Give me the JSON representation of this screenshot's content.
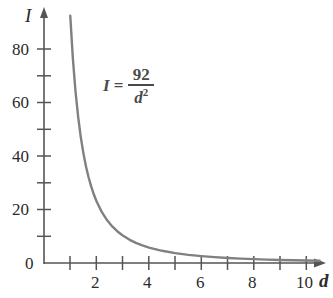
{
  "figure": {
    "background_color": "#ffffff",
    "curve_color": "#808080",
    "axis_color": "#555555",
    "text_color": "#2b2b2b",
    "annotation_color": "#4a4a4a"
  },
  "annotation": {
    "lhs": "I",
    "relation": "=",
    "numerator": "92",
    "denominator": "d",
    "denominator_exponent": "2",
    "full_text": "I = 92/d^2"
  },
  "axes": {
    "x_title": "d",
    "y_title": "I",
    "x_tick_labels": [
      "2",
      "4",
      "6",
      "8",
      "10"
    ],
    "y_tick_labels": [
      "0",
      "20",
      "40",
      "60",
      "80"
    ]
  },
  "chart_data": {
    "type": "line",
    "title": "",
    "subtitle": "",
    "xlabel": "d",
    "ylabel": "I",
    "xlim": [
      0,
      11.2
    ],
    "ylim": [
      0,
      92
    ],
    "grid": false,
    "legend": null,
    "annotations": [
      {
        "text": "I = 92/d^2",
        "x": 2.2,
        "y": 64
      }
    ],
    "x_ticks": [
      1,
      2,
      3,
      4,
      5,
      6,
      7,
      8,
      9,
      10
    ],
    "x_ticks_labeled": [
      2,
      4,
      6,
      8,
      10
    ],
    "y_ticks": [
      0,
      10,
      20,
      30,
      40,
      50,
      60,
      70,
      80
    ],
    "y_ticks_labeled": [
      0,
      20,
      40,
      60,
      80
    ],
    "equation": "I = 92 / d^2",
    "series": [
      {
        "name": "I = 92/d^2",
        "color": "#808080",
        "x": [
          1,
          1.1,
          1.2,
          1.3,
          1.4,
          1.5,
          1.6,
          1.7,
          1.8,
          1.9,
          2,
          2.2,
          2.4,
          2.6,
          2.8,
          3,
          3.25,
          3.5,
          3.75,
          4,
          4.5,
          5,
          5.5,
          6,
          6.5,
          7,
          7.5,
          8,
          8.5,
          9,
          9.5,
          10,
          10.5
        ],
        "y": [
          92,
          76.03,
          63.89,
          54.44,
          46.94,
          40.89,
          35.94,
          31.83,
          28.4,
          25.48,
          23,
          19.01,
          15.97,
          13.61,
          11.73,
          10.22,
          8.71,
          7.51,
          6.54,
          5.75,
          4.54,
          3.68,
          3.04,
          2.56,
          2.18,
          1.88,
          1.64,
          1.44,
          1.27,
          1.14,
          1.02,
          0.92,
          0.83
        ]
      }
    ]
  }
}
